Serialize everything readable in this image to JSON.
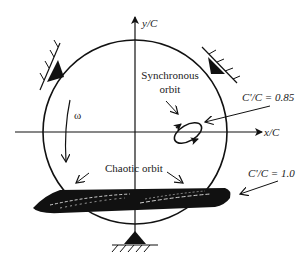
{
  "figure": {
    "axes": {
      "x_label": "x/C",
      "y_label": "y/C"
    },
    "labels": {
      "synchronous_line1": "Synchronous",
      "synchronous_line2": "orbit",
      "chaotic": "Chaotic orbit",
      "omega": "ω",
      "clearance_085": "C'/C = 0.85",
      "clearance_10": "C'/C = 1.0"
    },
    "supports": [
      "top-left",
      "top-right",
      "bottom"
    ],
    "colors": {
      "ink": "#111111",
      "background": "#ffffff"
    }
  }
}
